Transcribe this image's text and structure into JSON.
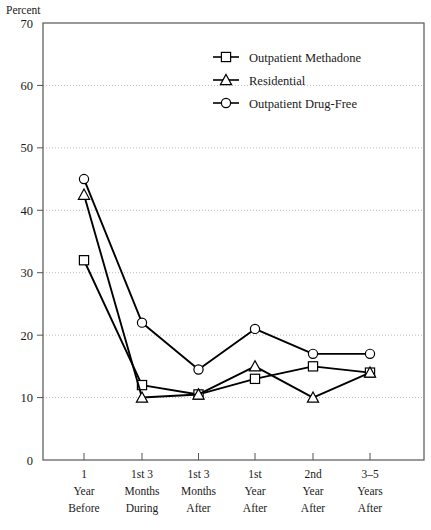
{
  "chart_data": {
    "type": "line",
    "title": "",
    "subtitle": "",
    "xlabel": "",
    "ylabel": "Percent",
    "ylim": [
      0,
      70
    ],
    "yticks": [
      0,
      10,
      20,
      30,
      40,
      50,
      60,
      70
    ],
    "ytick_labels": [
      "0",
      "10",
      "20",
      "30",
      "40",
      "50",
      "60",
      "70"
    ],
    "grid": true,
    "grid_axis": "y",
    "legend_position": "top-right",
    "categories": [
      "1\nYear\nBefore",
      "1st 3\nMonths\nDuring",
      "1st 3\nMonths\nAfter",
      "1st\nYear\nAfter",
      "2nd\nYear\nAfter",
      "3–5\nYears\nAfter"
    ],
    "category_lines": [
      [
        "1",
        "Year",
        "Before"
      ],
      [
        "1st 3",
        "Months",
        "During"
      ],
      [
        "1st 3",
        "Months",
        "After"
      ],
      [
        "1st",
        "Year",
        "After"
      ],
      [
        "2nd",
        "Year",
        "After"
      ],
      [
        "3–5",
        "Years",
        "After"
      ]
    ],
    "series": [
      {
        "name": "Outpatient Methadone",
        "marker": "square",
        "color": "#000000",
        "values": [
          32,
          12,
          10.5,
          13,
          15,
          14
        ]
      },
      {
        "name": "Residential",
        "marker": "triangle",
        "color": "#000000",
        "values": [
          42.5,
          10,
          10.5,
          15,
          10,
          14
        ]
      },
      {
        "name": "Outpatient Drug-Free",
        "marker": "circle",
        "color": "#000000",
        "values": [
          45,
          22,
          14.5,
          21,
          17,
          17
        ]
      }
    ]
  },
  "legend": {
    "items": [
      {
        "label": "Outpatient Methadone",
        "marker": "square"
      },
      {
        "label": "Residential",
        "marker": "triangle"
      },
      {
        "label": "Outpatient Drug-Free",
        "marker": "circle"
      }
    ]
  },
  "axis": {
    "unit_label": "Percent"
  },
  "colors": {
    "line": "#000000",
    "frame": "#555555",
    "grid": "#b9b9b9",
    "text": "#1a1a1a",
    "background": "#ffffff"
  }
}
